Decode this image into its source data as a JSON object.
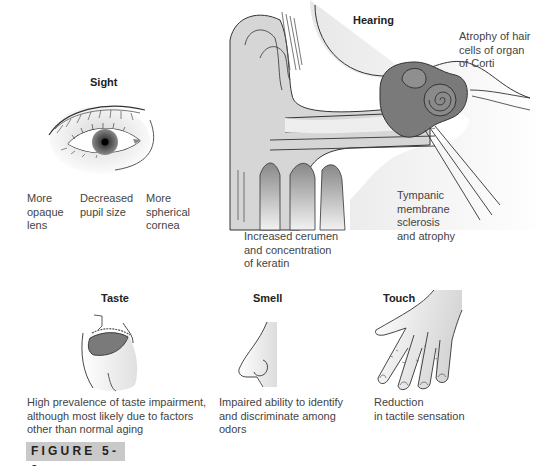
{
  "figure": {
    "label": "FIGURE 5-9",
    "panels": {
      "sight": {
        "title": "Sight",
        "icon": "eye-illustration",
        "annotations": [
          "More\nopaque\nlens",
          "Decreased\npupil size",
          "More\nspherical\ncornea"
        ]
      },
      "hearing": {
        "title": "Hearing",
        "icon": "ear-cross-section-illustration",
        "annotations": [
          "Atrophy of hair\ncells of organ\nof Corti",
          "Tympanic\nmembrane\nsclerosis\nand atrophy",
          "Increased cerumen\nand concentration\nof keratin"
        ]
      },
      "taste": {
        "title": "Taste",
        "icon": "mouth-tongue-illustration",
        "annotation": "High prevalence of taste impairment,\nalthough most likely due to factors\nother than normal aging"
      },
      "smell": {
        "title": "Smell",
        "icon": "nose-illustration",
        "annotation": "Impaired ability to identify\nand discriminate among\nodors"
      },
      "touch": {
        "title": "Touch",
        "icon": "hand-illustration",
        "annotation": "Reduction\nin tactile sensation"
      }
    },
    "colors": {
      "ink": "#333333",
      "light_fill": "#e3e3e3",
      "mid_fill": "#bdbdbd",
      "dark_fill": "#7a7a7a",
      "label_bg": "#c9c9c9"
    }
  }
}
